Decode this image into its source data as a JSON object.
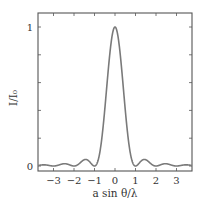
{
  "chart_data": {
    "type": "line",
    "title": "",
    "xlabel": "a sin θ/λ",
    "ylabel": "I/I₀",
    "xlim": [
      -3.75,
      3.75
    ],
    "ylim": [
      0,
      1
    ],
    "grid": false,
    "legend": null,
    "x_ticks": [
      -3,
      -2,
      -1,
      0,
      1,
      2,
      3
    ],
    "x_tick_labels": [
      "−3",
      "−2",
      "−1",
      "0",
      "1",
      "2",
      "3"
    ],
    "y_ticks": [
      0,
      0.2,
      0.4,
      0.6,
      0.8,
      1
    ],
    "y_tick_labels": [
      "0",
      "",
      "",
      "",
      "",
      "1"
    ],
    "series": [
      {
        "name": "I/I₀ = sinc²(a sin θ/λ)",
        "color": "#7a7a7a",
        "x": [
          -3.75,
          -3.625,
          -3.5,
          -3.375,
          -3.25,
          -3.125,
          -3.0,
          -2.875,
          -2.75,
          -2.625,
          -2.5,
          -2.375,
          -2.25,
          -2.125,
          -2.0,
          -1.875,
          -1.75,
          -1.625,
          -1.5,
          -1.375,
          -1.25,
          -1.125,
          -1.0,
          -0.875,
          -0.75,
          -0.625,
          -0.5,
          -0.375,
          -0.25,
          -0.125,
          0.0,
          0.125,
          0.25,
          0.375,
          0.5,
          0.625,
          0.75,
          0.875,
          1.0,
          1.125,
          1.25,
          1.375,
          1.5,
          1.625,
          1.75,
          1.875,
          2.0,
          2.125,
          2.25,
          2.375,
          2.5,
          2.625,
          2.75,
          2.875,
          3.0,
          3.125,
          3.25,
          3.375,
          3.5,
          3.625,
          3.75
        ],
        "values": [
          0.0036,
          0.0067,
          0.0083,
          0.0066,
          0.0038,
          0.0008,
          0.0,
          0.0014,
          0.0067,
          0.0123,
          0.0162,
          0.0152,
          0.008,
          0.0016,
          0.0,
          0.0023,
          0.0165,
          0.03,
          0.045,
          0.0447,
          0.0259,
          0.0063,
          0.0,
          0.0196,
          0.0901,
          0.2188,
          0.4053,
          0.6216,
          0.8106,
          0.9496,
          1.0,
          0.9496,
          0.8106,
          0.6216,
          0.4053,
          0.2188,
          0.0901,
          0.0196,
          0.0,
          0.0063,
          0.0259,
          0.0447,
          0.045,
          0.03,
          0.0165,
          0.0023,
          0.0,
          0.0016,
          0.008,
          0.0152,
          0.0162,
          0.0123,
          0.0067,
          0.0014,
          0.0,
          0.0008,
          0.0038,
          0.0066,
          0.0083,
          0.0067,
          0.0036
        ]
      }
    ]
  },
  "layout": {
    "plot_left": 38,
    "plot_right": 192,
    "plot_top": 13,
    "plot_bottom": 171,
    "x_zero_px": 115,
    "px_per_x": 20.5,
    "y_zero_px": 166,
    "px_per_y": 139,
    "frame_color": "#555555"
  }
}
